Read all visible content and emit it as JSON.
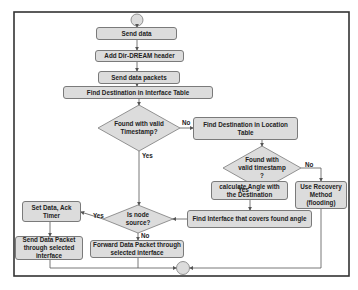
{
  "diagram": {
    "start_node": "start",
    "end_node": "end",
    "nodes": {
      "send_data": "Send data",
      "add_header": "Add Dir-DREAM header",
      "send_packets": "Send data packets",
      "find_interface_table": "Find Destination in Interface Table",
      "decision_valid_ts": "Found with valid Timestamp?",
      "find_location_table": "Find Destination in Location Table",
      "decision_valid_ts2": "Found with valid timestamp ?",
      "recovery": "Use Recovery Method (flooding)",
      "calc_angle": "calculate Angle with the Destination",
      "find_covering_interface": "Find Interface that covers found angle",
      "decision_source": "Is node source?",
      "set_ack": "Set Data, Ack Timer",
      "send_selected": "Send Data Packet through selected interface",
      "forward_selected": "Forward Data Packet through selected interface"
    },
    "edge_labels": {
      "d1_no": "No",
      "d1_yes": "Yes",
      "d2_no": "No",
      "d2_yes": "Yes",
      "d3_yes": "Yes",
      "d3_no": "No"
    },
    "colors": {
      "box_fill": "#dcdcdc",
      "box_border": "#7a7a7a",
      "line": "#555555",
      "frame": "#333333"
    }
  }
}
